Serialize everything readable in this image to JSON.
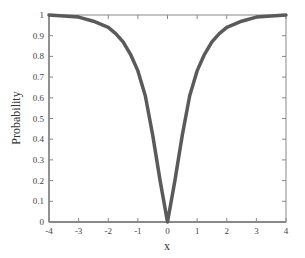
{
  "chart_data": {
    "type": "line",
    "title": "",
    "xlabel": "x",
    "ylabel": "Probability",
    "xlim": [
      -4,
      4
    ],
    "ylim": [
      0,
      1
    ],
    "x_ticks": [
      -4,
      -3,
      -2,
      -1,
      0,
      1,
      2,
      3,
      4
    ],
    "x_tick_labels": [
      "-4",
      "-3",
      "-2",
      "-1",
      "0",
      "1",
      "2",
      "3",
      "4"
    ],
    "y_ticks": [
      0,
      0.1,
      0.2,
      0.3,
      0.4,
      0.5,
      0.6,
      0.7,
      0.8,
      0.9,
      1
    ],
    "y_tick_labels": [
      "0",
      "0.1",
      "0.2",
      "0.3",
      "0.4",
      "0.5",
      "0.6",
      "0.7",
      "0.8",
      "0.9",
      "1"
    ],
    "grid": false,
    "legend": null,
    "series": [
      {
        "name": "Probability",
        "color": "#5a5a5a",
        "x": [
          -4,
          -3.5,
          -3,
          -2.5,
          -2,
          -1.75,
          -1.5,
          -1.25,
          -1,
          -0.75,
          -0.5,
          -0.25,
          0,
          0.25,
          0.5,
          0.75,
          1,
          1.25,
          1.5,
          1.75,
          2,
          2.5,
          3,
          3.5,
          4
        ],
        "y": [
          1.0,
          0.995,
          0.99,
          0.97,
          0.94,
          0.91,
          0.87,
          0.81,
          0.73,
          0.61,
          0.42,
          0.2,
          0.0,
          0.2,
          0.42,
          0.61,
          0.73,
          0.81,
          0.87,
          0.91,
          0.94,
          0.97,
          0.99,
          0.995,
          1.0
        ]
      }
    ]
  },
  "colors": {
    "curve": "#5a5a5a",
    "axis": "#888888",
    "text": "#444444"
  }
}
